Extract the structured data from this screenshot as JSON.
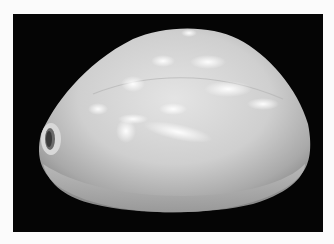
{
  "image": {
    "subject": "cowrie shell",
    "background_color": "#050505",
    "border_color": "#fbfbfb",
    "shell_color": "#c9c9c9",
    "highlight_color": "#f2f2f2",
    "shadow_color": "#8f8f8f"
  }
}
